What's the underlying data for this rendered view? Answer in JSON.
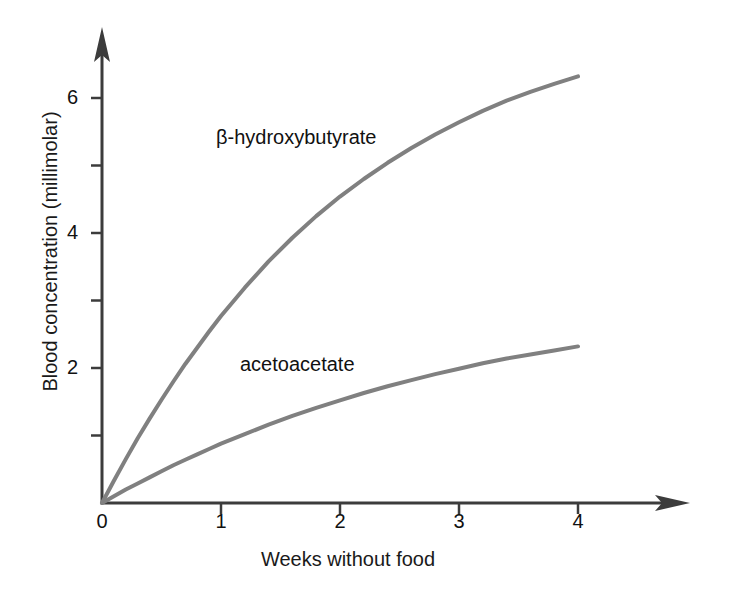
{
  "chart_data": {
    "type": "line",
    "title": "",
    "xlabel": "Weeks without food",
    "ylabel": "Blood concentration (millimolar)",
    "xlim": [
      0,
      4.5
    ],
    "ylim": [
      0,
      7.0
    ],
    "grid": false,
    "legend_position": "inline-labels",
    "x_ticks": [
      "0",
      "1",
      "2",
      "3",
      "4"
    ],
    "x_tick_values": [
      0,
      1,
      2,
      3,
      4
    ],
    "y_ticks": [
      "",
      "2",
      "",
      "4",
      "",
      "6"
    ],
    "y_tick_values": [
      1,
      2,
      3,
      4,
      5,
      6
    ],
    "y_major_labels": [
      "2",
      "4",
      "6"
    ],
    "axis_style": "arrow-tipped-open-axes",
    "series": [
      {
        "name": "β-hydroxybutyrate",
        "color": "#808080",
        "label_x": 216,
        "label_y": 128,
        "x": [
          0,
          0.1,
          0.2,
          0.3,
          0.4,
          0.5,
          0.6,
          0.7,
          0.8,
          0.9,
          1.0,
          1.2,
          1.4,
          1.6,
          1.8,
          2.0,
          2.2,
          2.4,
          2.6,
          2.8,
          3.0,
          3.2,
          3.4,
          3.6,
          3.8,
          4.0
        ],
        "values": [
          0.0,
          0.33,
          0.65,
          0.96,
          1.25,
          1.53,
          1.8,
          2.06,
          2.3,
          2.54,
          2.77,
          3.19,
          3.58,
          3.93,
          4.25,
          4.54,
          4.8,
          5.04,
          5.26,
          5.46,
          5.64,
          5.81,
          5.96,
          6.09,
          6.21,
          6.32
        ]
      },
      {
        "name": "acetoacetate",
        "color": "#808080",
        "label_x": 240,
        "label_y": 355,
        "x": [
          0,
          0.1,
          0.2,
          0.3,
          0.4,
          0.5,
          0.6,
          0.7,
          0.8,
          0.9,
          1.0,
          1.2,
          1.4,
          1.6,
          1.8,
          2.0,
          2.2,
          2.4,
          2.6,
          2.8,
          3.0,
          3.2,
          3.4,
          3.6,
          3.8,
          4.0
        ],
        "values": [
          0.0,
          0.1,
          0.2,
          0.29,
          0.38,
          0.47,
          0.56,
          0.64,
          0.72,
          0.8,
          0.88,
          1.02,
          1.16,
          1.29,
          1.41,
          1.52,
          1.63,
          1.73,
          1.82,
          1.91,
          1.99,
          2.07,
          2.14,
          2.2,
          2.26,
          2.32
        ]
      }
    ],
    "colors": {
      "curve": "#808080",
      "axis": "#3c3c3c",
      "text": "#111111",
      "background": "#ffffff"
    }
  },
  "geometry": {
    "origin_x": 102,
    "origin_y": 503,
    "px_per_week": 119,
    "px_per_mm": 67.5
  }
}
